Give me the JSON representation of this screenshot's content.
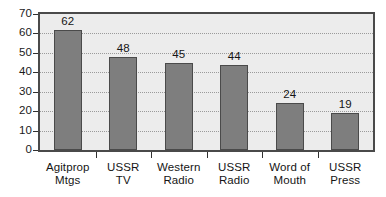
{
  "chart_data": {
    "type": "bar",
    "title": "",
    "subtitle": "",
    "xlabel": "",
    "ylabel": "",
    "categories": [
      "Agitprop Mtgs",
      "USSR TV",
      "Western Radio",
      "USSR Radio",
      "Word of Mouth",
      "USSR Press"
    ],
    "category_lines": [
      [
        "Agitprop",
        "Mtgs"
      ],
      [
        "USSR",
        "TV"
      ],
      [
        "Western",
        "Radio"
      ],
      [
        "USSR",
        "Radio"
      ],
      [
        "Word of",
        "Mouth"
      ],
      [
        "USSR",
        "Press"
      ]
    ],
    "values": [
      62,
      48,
      45,
      44,
      24,
      19
    ],
    "value_labels": [
      "62",
      "48",
      "45",
      "44",
      "24",
      "19"
    ],
    "ylim": [
      0,
      70
    ],
    "ytick_labels": [
      "0",
      "10",
      "20",
      "30",
      "40",
      "50",
      "60",
      "70"
    ],
    "ytick_values": [
      0,
      10,
      20,
      30,
      40,
      50,
      60,
      70
    ],
    "grid": true,
    "grid_axis": "y",
    "legend": false,
    "legend_position": "none"
  },
  "style": {
    "bar_fill": "#7e7e7e",
    "bar_edge": "#4a4a4a",
    "plot_background": "#ececec",
    "page_background": "#ffffff",
    "frame_color": "#4a4a4a",
    "gridline_color": "#9a9a9a",
    "text_color": "#151515"
  }
}
